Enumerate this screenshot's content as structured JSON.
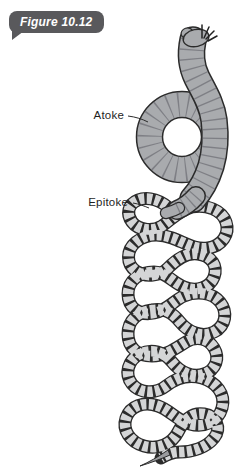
{
  "figure_tag": {
    "label": "Figure 10.12"
  },
  "annotations": {
    "atoke": {
      "label": "Atoke"
    },
    "epitoke": {
      "label": "Epitoke"
    }
  },
  "colors": {
    "background": "#ffffff",
    "tag_bg": "#59595c",
    "tag_text": "#ffffff",
    "label_text": "#1f1f1f",
    "outline": "#2b2b2b",
    "atoke_body": "#a9abae",
    "atoke_segment_lines": "#54545c",
    "epitoke_bead": "#d4d5d6",
    "tail_tip": "#9a9b9e",
    "leader_line": "#2b2b2b"
  }
}
